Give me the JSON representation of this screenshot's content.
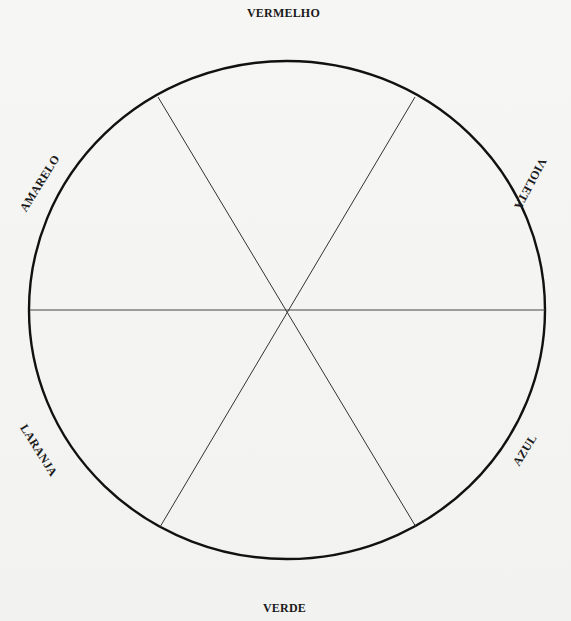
{
  "diagram": {
    "type": "color-wheel",
    "segments": 6,
    "labels": {
      "top": "VERMELHO",
      "upper_right": "VIOLETA",
      "lower_right": "AZUL",
      "bottom": "VERDE",
      "lower_left": "LARANJA",
      "upper_left": "AMARELO"
    },
    "geometry": {
      "center": [
        287,
        310
      ],
      "rx": 258,
      "ry": 249,
      "spokes": [
        {
          "from": [
            30,
            310
          ],
          "to": [
            545,
            310
          ]
        },
        {
          "from": [
            158,
            97
          ],
          "to": [
            416,
            527
          ]
        },
        {
          "from": [
            415,
            97
          ],
          "to": [
            160,
            527
          ]
        }
      ]
    },
    "colors": {
      "circle_stroke": "#111111",
      "spoke_stroke": "#333333",
      "background": "#f4f4f2",
      "text": "#1a1a1a"
    }
  }
}
